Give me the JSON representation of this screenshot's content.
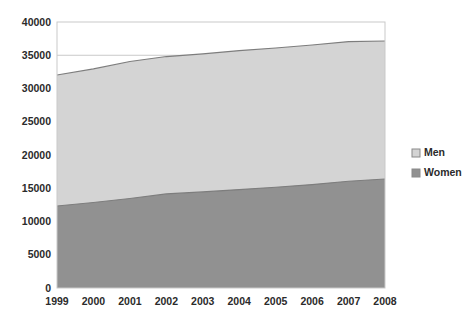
{
  "chart_data": {
    "type": "area",
    "title": "",
    "subtitle": "",
    "xlabel": "",
    "ylabel": "",
    "stacked": true,
    "grid": true,
    "legend_position": "right",
    "categories": [
      "1999",
      "2000",
      "2001",
      "2002",
      "2003",
      "2004",
      "2005",
      "2006",
      "2007",
      "2008"
    ],
    "x": [
      1999,
      2000,
      2001,
      2002,
      2003,
      2004,
      2005,
      2006,
      2007,
      2008
    ],
    "xlim": [
      1999,
      2008
    ],
    "ylim": [
      0,
      40000
    ],
    "yticks": [
      0,
      5000,
      10000,
      15000,
      20000,
      25000,
      30000,
      35000,
      40000
    ],
    "ytick_labels": [
      "0",
      "5000",
      "10000",
      "15000",
      "20000",
      "25000",
      "30000",
      "35000",
      "40000"
    ],
    "series": [
      {
        "name": "Women",
        "color": "#919191",
        "values": [
          12330,
          12850,
          13450,
          14150,
          14450,
          14800,
          15150,
          15550,
          16050,
          16400
        ]
      },
      {
        "name": "Men",
        "color": "#d4d4d4",
        "values": [
          19700,
          20100,
          20600,
          20650,
          20750,
          20900,
          20950,
          21000,
          21000,
          20750
        ]
      }
    ],
    "stack_totals": [
      32030,
      32950,
      34050,
      34800,
      35200,
      35700,
      36100,
      36550,
      37050,
      37150
    ],
    "annotations": []
  },
  "legend": {
    "items": [
      {
        "label": "Men",
        "color": "#d4d4d4"
      },
      {
        "label": "Women",
        "color": "#919191"
      }
    ]
  },
  "colors": {
    "men_area": "#d4d4d4",
    "women_area": "#919191",
    "border": "#c9c9c9",
    "gridline": "#c9c9c9",
    "series_line": "#7d7d7d",
    "text": "#2b2b2b",
    "background": "#ffffff"
  }
}
